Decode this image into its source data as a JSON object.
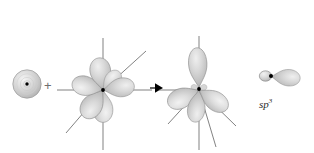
{
  "figure": {
    "type": "orbital-hybridization-diagram",
    "background_color": "#ffffff",
    "width": 314,
    "height": 153,
    "operator_plus": "+",
    "label_sp3_base": "sp",
    "label_sp3_exponent": "3",
    "colors": {
      "lobe_fill_light": "#e9e9e9",
      "lobe_fill_mid": "#c9c9c9",
      "lobe_fill_dark": "#a9a9a9",
      "lobe_stroke": "#8e8e8e",
      "axis_line": "#6b6b6b",
      "nucleus_dot": "#000000",
      "arrow_fill": "#000000",
      "text": "#2a2a2a"
    },
    "groups": [
      {
        "name": "s-orbital",
        "role": "spherical s orbital reactant",
        "center_x": 27,
        "center_y": 84,
        "radius": 14,
        "lobe_count": 1
      },
      {
        "name": "three-p-orbitals",
        "role": "three p orbitals reactant",
        "center_x": 103,
        "center_y": 90,
        "lobe_count": 6
      },
      {
        "name": "four-sp3-hybrid-orbitals",
        "role": "four sp3 hybrid orbitals product",
        "center_x": 199,
        "center_y": 90,
        "lobe_count": 4
      },
      {
        "name": "single-sp3-orbital",
        "role": "isolated single sp3 hybrid orbital callout",
        "center_x": 272,
        "center_y": 76,
        "lobe_count": 2
      }
    ],
    "arrow": {
      "name": "reaction-arrow",
      "x": 156,
      "y": 88,
      "direction": "right"
    }
  }
}
